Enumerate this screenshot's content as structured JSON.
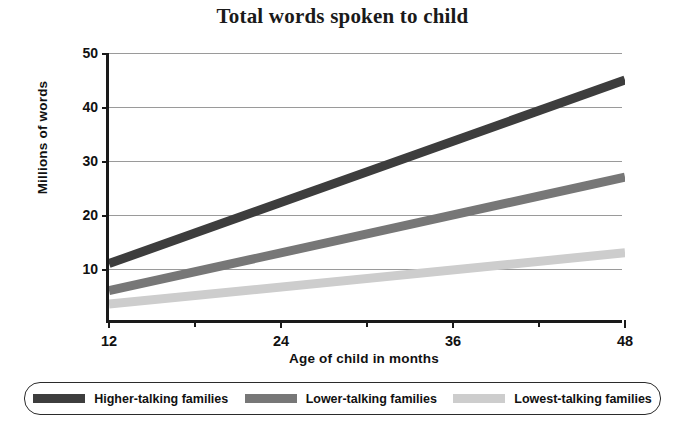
{
  "chart_data": {
    "type": "line",
    "title": "Total words spoken to child",
    "xlabel": "Age of child in months",
    "ylabel": "Millions of words",
    "xlim": [
      12,
      48
    ],
    "ylim": [
      0,
      50
    ],
    "x": [
      12,
      48
    ],
    "xticks": [
      12,
      24,
      36,
      48
    ],
    "xtick_labels": [
      "12",
      "24",
      "36",
      "48"
    ],
    "xminor_ticks": [
      18,
      30,
      42
    ],
    "yticks": [
      10,
      20,
      30,
      40,
      50
    ],
    "ytick_labels": [
      "10",
      "20",
      "30",
      "40",
      "50"
    ],
    "grid": "horizontal",
    "legend_position": "bottom",
    "series": [
      {
        "name": "Higher-talking families",
        "color": "#3d3d3d",
        "values": [
          11,
          45
        ]
      },
      {
        "name": "Lower-talking families",
        "color": "#777777",
        "values": [
          6,
          27
        ]
      },
      {
        "name": "Lowest-talking families",
        "color": "#cdcdcd",
        "values": [
          3.5,
          13
        ]
      }
    ]
  },
  "axis": {
    "line_color": "#1a1a1a",
    "grid_color": "#9a9a9a"
  }
}
